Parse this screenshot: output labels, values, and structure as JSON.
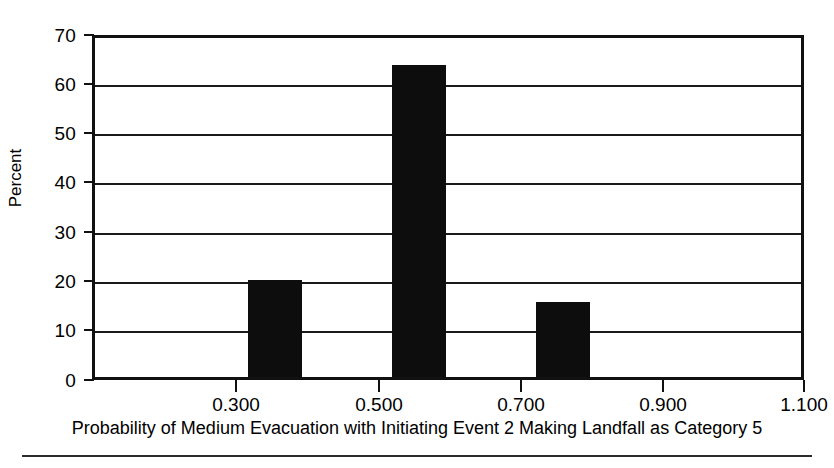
{
  "chart_data": {
    "type": "bar",
    "title": "",
    "subtitle": "",
    "xlabel": "Probability of Medium Evacuation with Initiating Event 2 Making Landfall as Category 5",
    "ylabel": "Percent",
    "xlim": [
      0.2,
      1.18
    ],
    "ylim": [
      0,
      70
    ],
    "grid": true,
    "legend": null,
    "legend_position": "none",
    "x_tick_labels": [
      "0.300",
      "0.500",
      "0.700",
      "0.900",
      "1.100"
    ],
    "x_tick_values": [
      0.3,
      0.5,
      0.7,
      0.9,
      1.1
    ],
    "y_tick_labels": [
      "0",
      "10",
      "20",
      "30",
      "40",
      "50",
      "60",
      "70"
    ],
    "y_tick_values": [
      0,
      10,
      20,
      30,
      40,
      50,
      60,
      70
    ],
    "bin_width": 0.1,
    "bar_width_fraction": 0.75,
    "categories": [
      "0.450",
      "0.550",
      "0.650",
      "0.750",
      "0.850"
    ],
    "values": [
      20.0,
      0.0,
      64.5,
      0.0,
      15.4
    ],
    "bars": [
      {
        "label": "0.450",
        "center": 0.45,
        "value": 20.0
      },
      {
        "label": "0.650",
        "center": 0.65,
        "value": 64.5
      },
      {
        "label": "0.850",
        "center": 0.85,
        "value": 15.4
      }
    ],
    "colors": {
      "bar": "#0d0d0d",
      "axis": "#111111",
      "gridline": "#1a1a1a",
      "background": "#ffffff",
      "text": "#000000"
    }
  }
}
